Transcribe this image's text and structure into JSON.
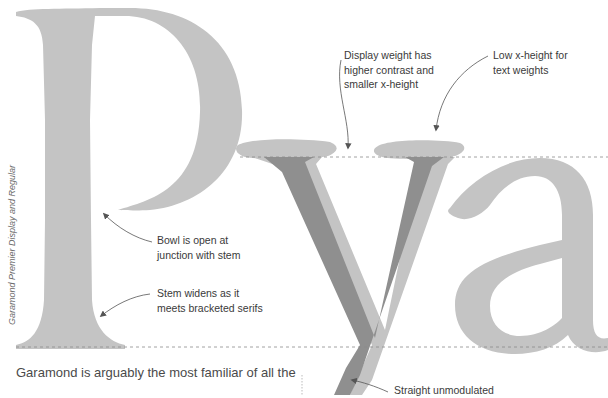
{
  "figure": {
    "side_caption": "Garamond Premier Display and Regular",
    "glyphs": [
      "P",
      "y",
      "a"
    ],
    "colors": {
      "regular_glyph": "#c4c4c4",
      "display_glyph": "#8f8f8f",
      "guide_line": "#9a9a9a",
      "arrow": "#555555",
      "text": "#3a3a3a"
    },
    "guides": {
      "x_height_label": "x-height line",
      "baseline_label": "baseline"
    }
  },
  "annotations": {
    "display_weight": {
      "line1": "Display weight has",
      "line2": "higher contrast and",
      "line3": "smaller x-height"
    },
    "low_x_height": {
      "line1": "Low x-height for",
      "line2": "text weights"
    },
    "bowl_open": {
      "line1": "Bowl is open at",
      "line2": "junction with stem"
    },
    "stem_widens": {
      "line1": "Stem widens as it",
      "line2": "meets bracketed serifs"
    },
    "straight_unmodulated": {
      "line1": "Straight unmodulated"
    }
  },
  "body": {
    "paragraph_line1": "Garamond is arguably the most familiar of all the"
  }
}
